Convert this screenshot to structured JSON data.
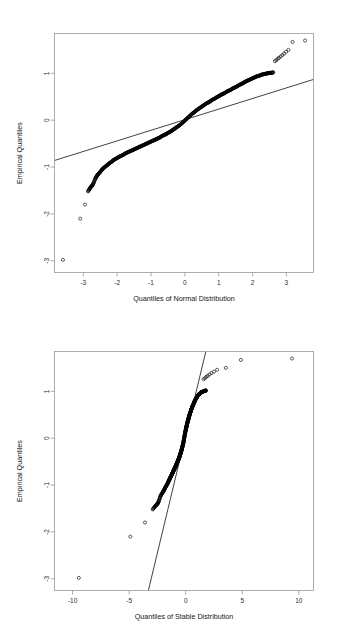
{
  "figure": {
    "background": "#ffffff",
    "foreground": "#000000",
    "axis_color": "#8a8a8a",
    "panels": 2,
    "layout": "stacked-vertical"
  },
  "chart_data": [
    {
      "id": "normal-qq",
      "type": "scatter",
      "title": "",
      "subtitle": "",
      "xlabel": "Quantiles of Normal Distribution",
      "ylabel": "Empirical Quantiles",
      "xticks": [
        -3,
        -2,
        -1,
        0,
        1,
        2,
        3
      ],
      "xticklabels": [
        "-3",
        "-2",
        "-1",
        "0",
        "1",
        "2",
        "3"
      ],
      "yticks": [
        1,
        0,
        -1,
        -2,
        -3
      ],
      "yticklabels": [
        "1",
        "0",
        "-1",
        "-2",
        "-3"
      ],
      "xlim": [
        -3.85,
        3.8
      ],
      "ylim": [
        -3.25,
        1.85
      ],
      "grid": false,
      "legend": null,
      "marker": "open-circle",
      "reference_line": {
        "name": "qq-reference-line",
        "type": "line",
        "description": "quantile-quantile reference line through first and third quartiles",
        "x0": -3.85,
        "y0": -0.86,
        "x1": 3.8,
        "y1": 0.87
      },
      "series": [
        {
          "name": "empirical-vs-normal-quantiles",
          "n_points": 512,
          "points": [
            [
              -3.6,
              -2.98
            ],
            [
              -3.09,
              -2.1
            ],
            [
              -2.95,
              -1.8
            ],
            [
              -2.86,
              -1.52
            ],
            [
              -2.81,
              -1.46
            ],
            [
              -2.77,
              -1.42
            ],
            [
              -2.73,
              -1.39
            ],
            [
              -2.69,
              -1.33
            ],
            [
              -2.64,
              -1.24
            ],
            [
              -2.6,
              -1.19
            ],
            [
              -2.56,
              -1.15
            ],
            [
              -2.52,
              -1.12
            ],
            [
              -2.47,
              -1.08
            ],
            [
              -2.43,
              -1.04
            ],
            [
              -2.38,
              -1.01
            ],
            [
              -2.33,
              -0.98
            ],
            [
              -2.28,
              -0.95
            ],
            [
              -2.23,
              -0.92
            ],
            [
              -2.17,
              -0.89
            ],
            [
              -2.12,
              -0.86
            ],
            [
              -2.06,
              -0.83
            ],
            [
              -2.0,
              -0.81
            ],
            [
              -1.94,
              -0.78
            ],
            [
              -1.88,
              -0.76
            ],
            [
              -1.82,
              -0.74
            ],
            [
              -1.76,
              -0.71
            ],
            [
              -1.7,
              -0.69
            ],
            [
              -1.64,
              -0.67
            ],
            [
              -1.58,
              -0.65
            ],
            [
              -1.52,
              -0.63
            ],
            [
              -1.46,
              -0.61
            ],
            [
              -1.4,
              -0.59
            ],
            [
              -1.34,
              -0.57
            ],
            [
              -1.28,
              -0.55
            ],
            [
              -1.22,
              -0.53
            ],
            [
              -1.16,
              -0.51
            ],
            [
              -1.1,
              -0.49
            ],
            [
              -1.04,
              -0.47
            ],
            [
              -0.98,
              -0.45
            ],
            [
              -0.92,
              -0.43
            ],
            [
              -0.86,
              -0.41
            ],
            [
              -0.8,
              -0.39
            ],
            [
              -0.74,
              -0.37
            ],
            [
              -0.68,
              -0.34
            ],
            [
              -0.62,
              -0.32
            ],
            [
              -0.56,
              -0.3
            ],
            [
              -0.5,
              -0.27
            ],
            [
              -0.44,
              -0.25
            ],
            [
              -0.38,
              -0.22
            ],
            [
              -0.32,
              -0.19
            ],
            [
              -0.26,
              -0.16
            ],
            [
              -0.2,
              -0.13
            ],
            [
              -0.14,
              -0.1
            ],
            [
              -0.08,
              -0.06
            ],
            [
              -0.02,
              -0.02
            ],
            [
              0.04,
              0.02
            ],
            [
              0.1,
              0.06
            ],
            [
              0.16,
              0.1
            ],
            [
              0.22,
              0.14
            ],
            [
              0.28,
              0.17
            ],
            [
              0.34,
              0.21
            ],
            [
              0.4,
              0.24
            ],
            [
              0.46,
              0.27
            ],
            [
              0.52,
              0.3
            ],
            [
              0.58,
              0.33
            ],
            [
              0.64,
              0.36
            ],
            [
              0.7,
              0.38
            ],
            [
              0.76,
              0.41
            ],
            [
              0.82,
              0.44
            ],
            [
              0.88,
              0.46
            ],
            [
              0.94,
              0.49
            ],
            [
              1.0,
              0.51
            ],
            [
              1.06,
              0.54
            ],
            [
              1.12,
              0.56
            ],
            [
              1.18,
              0.58
            ],
            [
              1.24,
              0.61
            ],
            [
              1.3,
              0.63
            ],
            [
              1.36,
              0.65
            ],
            [
              1.42,
              0.68
            ],
            [
              1.48,
              0.7
            ],
            [
              1.54,
              0.72
            ],
            [
              1.6,
              0.75
            ],
            [
              1.66,
              0.77
            ],
            [
              1.72,
              0.79
            ],
            [
              1.78,
              0.82
            ],
            [
              1.84,
              0.84
            ],
            [
              1.9,
              0.86
            ],
            [
              1.96,
              0.88
            ],
            [
              2.02,
              0.9
            ],
            [
              2.08,
              0.92
            ],
            [
              2.14,
              0.94
            ],
            [
              2.2,
              0.95
            ],
            [
              2.26,
              0.97
            ],
            [
              2.32,
              0.98
            ],
            [
              2.38,
              0.99
            ],
            [
              2.44,
              1.0
            ],
            [
              2.5,
              1.01
            ],
            [
              2.56,
              1.01
            ],
            [
              2.61,
              1.02
            ],
            [
              2.66,
              1.26
            ],
            [
              2.7,
              1.28
            ],
            [
              2.74,
              1.31
            ],
            [
              2.78,
              1.33
            ],
            [
              2.83,
              1.36
            ],
            [
              2.88,
              1.39
            ],
            [
              2.93,
              1.42
            ],
            [
              2.99,
              1.46
            ],
            [
              3.06,
              1.5
            ],
            [
              3.18,
              1.67
            ],
            [
              3.55,
              1.7
            ]
          ]
        }
      ]
    },
    {
      "id": "stable-qq",
      "type": "scatter",
      "title": "",
      "subtitle": "",
      "xlabel": "Quantiles of Stable Distribution",
      "ylabel": "Empirical Quantiles",
      "xticks": [
        -10,
        -5,
        0,
        5,
        10
      ],
      "xticklabels": [
        "-10",
        "-5",
        "0",
        "5",
        "10"
      ],
      "yticks": [
        1,
        0,
        -1,
        -2,
        -3
      ],
      "yticklabels": [
        "1",
        "0",
        "-1",
        "-2",
        "-3"
      ],
      "xlim": [
        -11.6,
        11.3
      ],
      "ylim": [
        -3.25,
        1.85
      ],
      "grid": false,
      "legend": null,
      "marker": "open-circle",
      "reference_line": {
        "name": "qq-reference-line",
        "type": "line",
        "description": "quantile-quantile reference line through first and third quartiles",
        "x0": -3.3,
        "y0": -3.25,
        "x1": 1.78,
        "y1": 1.85
      },
      "series": [
        {
          "name": "empirical-vs-stable-quantiles",
          "n_points": 512,
          "points": [
            [
              -9.45,
              -2.98
            ],
            [
              -4.9,
              -2.1
            ],
            [
              -3.6,
              -1.8
            ],
            [
              -2.92,
              -1.52
            ],
            [
              -2.72,
              -1.46
            ],
            [
              -2.58,
              -1.42
            ],
            [
              -2.46,
              -1.39
            ],
            [
              -2.36,
              -1.33
            ],
            [
              -2.24,
              -1.24
            ],
            [
              -2.12,
              -1.19
            ],
            [
              -2.02,
              -1.15
            ],
            [
              -1.94,
              -1.12
            ],
            [
              -1.86,
              -1.08
            ],
            [
              -1.78,
              -1.04
            ],
            [
              -1.7,
              -1.01
            ],
            [
              -1.63,
              -0.98
            ],
            [
              -1.57,
              -0.95
            ],
            [
              -1.51,
              -0.92
            ],
            [
              -1.45,
              -0.89
            ],
            [
              -1.4,
              -0.86
            ],
            [
              -1.34,
              -0.83
            ],
            [
              -1.29,
              -0.81
            ],
            [
              -1.24,
              -0.78
            ],
            [
              -1.2,
              -0.76
            ],
            [
              -1.15,
              -0.74
            ],
            [
              -1.11,
              -0.71
            ],
            [
              -1.07,
              -0.69
            ],
            [
              -1.03,
              -0.67
            ],
            [
              -0.99,
              -0.65
            ],
            [
              -0.95,
              -0.63
            ],
            [
              -0.91,
              -0.61
            ],
            [
              -0.87,
              -0.59
            ],
            [
              -0.84,
              -0.57
            ],
            [
              -0.8,
              -0.55
            ],
            [
              -0.77,
              -0.53
            ],
            [
              -0.73,
              -0.51
            ],
            [
              -0.7,
              -0.49
            ],
            [
              -0.67,
              -0.47
            ],
            [
              -0.63,
              -0.45
            ],
            [
              -0.6,
              -0.43
            ],
            [
              -0.57,
              -0.41
            ],
            [
              -0.54,
              -0.39
            ],
            [
              -0.51,
              -0.37
            ],
            [
              -0.48,
              -0.34
            ],
            [
              -0.45,
              -0.32
            ],
            [
              -0.42,
              -0.3
            ],
            [
              -0.39,
              -0.27
            ],
            [
              -0.36,
              -0.25
            ],
            [
              -0.33,
              -0.22
            ],
            [
              -0.3,
              -0.19
            ],
            [
              -0.27,
              -0.16
            ],
            [
              -0.24,
              -0.13
            ],
            [
              -0.21,
              -0.1
            ],
            [
              -0.18,
              -0.06
            ],
            [
              -0.15,
              -0.02
            ],
            [
              -0.12,
              0.02
            ],
            [
              -0.09,
              0.06
            ],
            [
              -0.06,
              0.1
            ],
            [
              -0.03,
              0.14
            ],
            [
              0.0,
              0.17
            ],
            [
              0.03,
              0.21
            ],
            [
              0.06,
              0.24
            ],
            [
              0.09,
              0.27
            ],
            [
              0.12,
              0.3
            ],
            [
              0.15,
              0.33
            ],
            [
              0.18,
              0.36
            ],
            [
              0.21,
              0.38
            ],
            [
              0.24,
              0.41
            ],
            [
              0.27,
              0.44
            ],
            [
              0.3,
              0.46
            ],
            [
              0.33,
              0.49
            ],
            [
              0.36,
              0.51
            ],
            [
              0.39,
              0.54
            ],
            [
              0.43,
              0.56
            ],
            [
              0.46,
              0.58
            ],
            [
              0.49,
              0.61
            ],
            [
              0.53,
              0.63
            ],
            [
              0.56,
              0.65
            ],
            [
              0.6,
              0.68
            ],
            [
              0.64,
              0.7
            ],
            [
              0.68,
              0.72
            ],
            [
              0.72,
              0.75
            ],
            [
              0.76,
              0.77
            ],
            [
              0.8,
              0.79
            ],
            [
              0.85,
              0.82
            ],
            [
              0.9,
              0.84
            ],
            [
              0.95,
              0.86
            ],
            [
              1.0,
              0.88
            ],
            [
              1.06,
              0.9
            ],
            [
              1.12,
              0.92
            ],
            [
              1.18,
              0.94
            ],
            [
              1.25,
              0.95
            ],
            [
              1.32,
              0.97
            ],
            [
              1.4,
              0.98
            ],
            [
              1.49,
              0.99
            ],
            [
              1.58,
              1.0
            ],
            [
              1.68,
              1.01
            ],
            [
              1.74,
              1.01
            ],
            [
              1.78,
              1.02
            ],
            [
              1.58,
              1.26
            ],
            [
              1.7,
              1.28
            ],
            [
              1.82,
              1.31
            ],
            [
              1.95,
              1.33
            ],
            [
              2.1,
              1.36
            ],
            [
              2.28,
              1.39
            ],
            [
              2.5,
              1.42
            ],
            [
              2.78,
              1.46
            ],
            [
              3.55,
              1.5
            ],
            [
              4.88,
              1.67
            ],
            [
              9.4,
              1.7
            ]
          ]
        }
      ]
    }
  ]
}
